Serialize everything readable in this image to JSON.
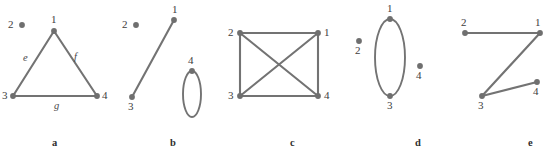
{
  "figure": {
    "background_color": "#ffffff",
    "stroke_color": "#737373",
    "vertex_color": "#6f6f6f",
    "label_color": "#3d3d3d",
    "width": 548,
    "height": 155,
    "panels": [
      {
        "caption": "a",
        "caption_x": 52,
        "caption_y": 138,
        "vertices": [
          {
            "id": "1",
            "x": 54,
            "y": 31,
            "label": "1",
            "label_x": 51,
            "label_y": 14,
            "isolated": false
          },
          {
            "id": "2",
            "x": 22,
            "y": 25,
            "label": "2",
            "label_x": 8,
            "label_y": 19,
            "isolated": true
          },
          {
            "id": "3",
            "x": 13,
            "y": 96,
            "label": "3",
            "label_x": 2,
            "label_y": 90,
            "isolated": false
          },
          {
            "id": "4",
            "x": 97,
            "y": 96,
            "label": "4",
            "label_x": 102,
            "label_y": 90,
            "isolated": false
          }
        ],
        "edges": [
          {
            "from": "1",
            "to": "3",
            "label": "e",
            "label_x": 23,
            "label_y": 53
          },
          {
            "from": "1",
            "to": "4",
            "label": "f",
            "label_x": 74,
            "label_y": 52
          },
          {
            "from": "3",
            "to": "4",
            "label": "g",
            "label_x": 54,
            "label_y": 101
          }
        ],
        "loops": []
      },
      {
        "caption": "b",
        "caption_x": 170,
        "caption_y": 138,
        "vertices": [
          {
            "id": "1",
            "x": 174,
            "y": 20,
            "label": "1",
            "label_x": 172,
            "label_y": 4,
            "isolated": false
          },
          {
            "id": "2",
            "x": 136,
            "y": 25,
            "label": "2",
            "label_x": 122,
            "label_y": 19,
            "isolated": true
          },
          {
            "id": "3",
            "x": 132,
            "y": 97,
            "label": "3",
            "label_x": 128,
            "label_y": 101,
            "isolated": false
          },
          {
            "id": "4",
            "x": 192,
            "y": 71,
            "label": "4",
            "label_x": 188,
            "label_y": 55,
            "isolated": false
          }
        ],
        "edges": [
          {
            "from": "1",
            "to": "3",
            "label": "",
            "label_x": 0,
            "label_y": 0
          }
        ],
        "loops": [
          {
            "at": "4",
            "cx": 192,
            "cy": 94,
            "rx": 9,
            "ry": 23
          }
        ]
      },
      {
        "caption": "c",
        "caption_x": 290,
        "caption_y": 138,
        "vertices": [
          {
            "id": "1",
            "x": 318,
            "y": 33,
            "label": "1",
            "label_x": 324,
            "label_y": 27,
            "isolated": false
          },
          {
            "id": "2",
            "x": 240,
            "y": 33,
            "label": "2",
            "label_x": 228,
            "label_y": 27,
            "isolated": false
          },
          {
            "id": "3",
            "x": 240,
            "y": 96,
            "label": "3",
            "label_x": 228,
            "label_y": 90,
            "isolated": false
          },
          {
            "id": "4",
            "x": 318,
            "y": 96,
            "label": "4",
            "label_x": 324,
            "label_y": 90,
            "isolated": false
          }
        ],
        "edges": [
          {
            "from": "2",
            "to": "1",
            "label": "",
            "label_x": 0,
            "label_y": 0
          },
          {
            "from": "2",
            "to": "3",
            "label": "",
            "label_x": 0,
            "label_y": 0
          },
          {
            "from": "3",
            "to": "4",
            "label": "",
            "label_x": 0,
            "label_y": 0
          },
          {
            "from": "1",
            "to": "4",
            "label": "",
            "label_x": 0,
            "label_y": 0
          },
          {
            "from": "2",
            "to": "4",
            "label": "",
            "label_x": 0,
            "label_y": 0
          },
          {
            "from": "1",
            "to": "3",
            "label": "",
            "label_x": 0,
            "label_y": 0
          }
        ],
        "loops": []
      },
      {
        "caption": "d",
        "caption_x": 415,
        "caption_y": 138,
        "vertices": [
          {
            "id": "1",
            "x": 390,
            "y": 19,
            "label": "1",
            "label_x": 387,
            "label_y": 3,
            "isolated": false
          },
          {
            "id": "2",
            "x": 359,
            "y": 41,
            "label": "2",
            "label_x": 355,
            "label_y": 45,
            "isolated": true
          },
          {
            "id": "3",
            "x": 390,
            "y": 96,
            "label": "3",
            "label_x": 387,
            "label_y": 100,
            "isolated": false
          },
          {
            "id": "4",
            "x": 420,
            "y": 66,
            "label": "4",
            "label_x": 416,
            "label_y": 70,
            "isolated": true
          }
        ],
        "edges": [],
        "loops": [
          {
            "at": "1",
            "cx": 390,
            "cy": 57.5,
            "rx": 15,
            "ry": 38.5
          }
        ]
      },
      {
        "caption": "e",
        "caption_x": 528,
        "caption_y": 138,
        "vertices": [
          {
            "id": "1",
            "x": 540,
            "y": 33,
            "label": "1",
            "label_x": 535,
            "label_y": 17,
            "isolated": false
          },
          {
            "id": "2",
            "x": 465,
            "y": 33,
            "label": "2",
            "label_x": 461,
            "label_y": 17,
            "isolated": false
          },
          {
            "id": "3",
            "x": 482,
            "y": 96,
            "label": "3",
            "label_x": 478,
            "label_y": 100,
            "isolated": false
          },
          {
            "id": "4",
            "x": 537,
            "y": 82,
            "label": "4",
            "label_x": 533,
            "label_y": 86,
            "isolated": false
          }
        ],
        "edges": [
          {
            "from": "2",
            "to": "1",
            "label": "",
            "label_x": 0,
            "label_y": 0
          },
          {
            "from": "1",
            "to": "3",
            "label": "",
            "label_x": 0,
            "label_y": 0
          },
          {
            "from": "3",
            "to": "4",
            "label": "",
            "label_x": 0,
            "label_y": 0
          }
        ],
        "loops": []
      }
    ]
  }
}
